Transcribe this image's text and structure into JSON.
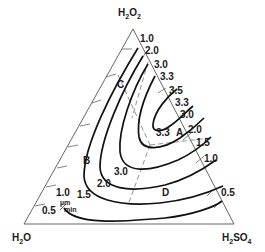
{
  "diagram": {
    "type": "ternary-contour",
    "vertices": {
      "top": {
        "base": "H",
        "s1": "2",
        "mid": "O",
        "s2": "2"
      },
      "bottom_left": {
        "base": "H",
        "s1": "2",
        "mid": "O",
        "s2": ""
      },
      "bottom_right": {
        "base": "H",
        "s1": "2",
        "mid": "SO",
        "s2": "4"
      }
    },
    "right_edge_labels": [
      "1.0",
      "2.0",
      "3.0",
      "3.3",
      "3.5",
      "3.3",
      "3.0",
      "2.0",
      "1.5",
      "1.0",
      "0.5"
    ],
    "interior_labels": {
      "a_value": "3.3",
      "center_value": "3.0",
      "left_value": "2.0",
      "lower_left_value": "1.5",
      "edge_left_value": "1.0",
      "outer_value": "0.5"
    },
    "unit": {
      "top": "µm",
      "bottom": "min"
    },
    "regions": [
      "A",
      "B",
      "C",
      "D"
    ],
    "colors": {
      "contour": "#111111",
      "edge": "#555555",
      "dashed": "#777777",
      "text": "#1a1a1a"
    }
  }
}
